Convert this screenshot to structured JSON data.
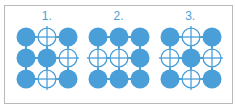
{
  "figure": {
    "border_color": "#b9b9b9",
    "background_color": "#ffffff",
    "accent_color": "#4a9fd8",
    "outline_color": "#4a9fd8"
  },
  "groups": [
    {
      "label": "1.",
      "label_name": "group-label-1",
      "rows": [
        [
          "filled",
          "cross",
          "filled"
        ],
        [
          "filled",
          "filled",
          "cross"
        ],
        [
          "filled",
          "cross",
          "filled"
        ]
      ],
      "filled_count": 6,
      "cross_count": 3
    },
    {
      "label": "2.",
      "label_name": "group-label-2",
      "rows": [
        [
          "filled",
          "filled",
          "filled"
        ],
        [
          "cross",
          "cross",
          "filled"
        ],
        [
          "filled",
          "filled",
          "filled"
        ]
      ],
      "filled_count": 7,
      "cross_count": 2
    },
    {
      "label": "3.",
      "label_name": "group-label-3",
      "rows": [
        [
          "filled",
          "cross",
          "filled"
        ],
        [
          "cross",
          "filled",
          "cross"
        ],
        [
          "filled",
          "cross",
          "filled"
        ]
      ],
      "filled_count": 5,
      "cross_count": 4
    }
  ],
  "geometry": {
    "cell_pitch": 22,
    "circle_radius": 9.5,
    "origin_x": 12,
    "origin_y": 12,
    "connector_width": 2
  }
}
